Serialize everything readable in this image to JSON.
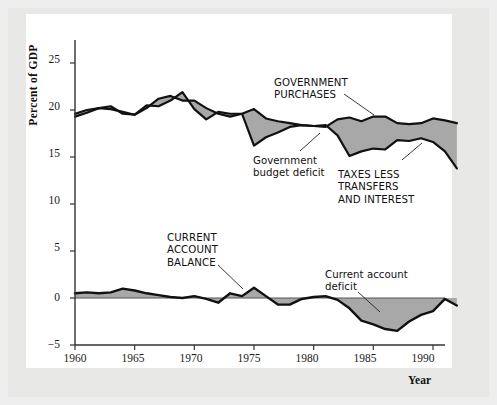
{
  "figure": {
    "name": "government-purchases-taxes-current-account-chart",
    "background_color": "#e8e8e6",
    "plot_background_color": "#ffffff",
    "fill_color": "#a8a8a8",
    "line_color": "#111111"
  },
  "axes": {
    "ylabel": "Percent of GDP",
    "xlabel": "Year",
    "y_ticks": [
      "25",
      "20",
      "15",
      "10",
      "5",
      "0",
      "−5"
    ],
    "y_tick_values": [
      25,
      20,
      15,
      10,
      5,
      0,
      -5
    ],
    "x_ticks": [
      "1960",
      "1965",
      "1970",
      "1975",
      "1980",
      "1985",
      "1990"
    ],
    "x_tick_values": [
      1960,
      1965,
      1970,
      1975,
      1980,
      1985,
      1990
    ]
  },
  "annotations": [
    {
      "id": "government-purchases",
      "text": "GOVERNMENT\nPURCHASES",
      "style": "caps"
    },
    {
      "id": "government-budget-deficit",
      "text": "Government\nbudget deficit",
      "style": "sentence"
    },
    {
      "id": "taxes-less-transfers-and-interest",
      "text": "TAXES LESS\nTRANSFERS\nAND INTEREST",
      "style": "caps"
    },
    {
      "id": "current-account-balance",
      "text": "CURRENT\nACCOUNT\nBALANCE",
      "style": "caps"
    },
    {
      "id": "current-account-deficit",
      "text": "Current account\ndeficit",
      "style": "sentence"
    }
  ],
  "chart_data": {
    "type": "area",
    "title": "",
    "xlabel": "Year",
    "ylabel": "Percent of GDP",
    "xlim": [
      1960,
      1992
    ],
    "ylim": [
      -5,
      26.5
    ],
    "grid": false,
    "legend": "annotations-inline",
    "x": [
      1960,
      1961,
      1962,
      1963,
      1964,
      1965,
      1966,
      1967,
      1968,
      1969,
      1970,
      1971,
      1972,
      1973,
      1974,
      1975,
      1976,
      1977,
      1978,
      1979,
      1980,
      1981,
      1982,
      1983,
      1984,
      1985,
      1986,
      1987,
      1988,
      1989,
      1990,
      1991,
      1992
    ],
    "series": [
      {
        "name": "GOVERNMENT PURCHASES",
        "values": [
          19.6,
          20.0,
          20.2,
          20.1,
          19.8,
          19.5,
          20.2,
          21.2,
          21.5,
          21.0,
          21.0,
          20.2,
          19.6,
          19.3,
          19.6,
          20.1,
          19.1,
          18.8,
          18.6,
          18.4,
          18.3,
          18.2,
          19.0,
          19.2,
          18.8,
          19.3,
          19.3,
          18.6,
          18.5,
          18.6,
          19.1,
          18.9,
          18.6
        ]
      },
      {
        "name": "TAXES LESS TRANSFERS AND INTEREST",
        "values": [
          19.3,
          19.7,
          20.2,
          20.4,
          19.6,
          19.5,
          20.5,
          20.4,
          21.0,
          21.9,
          20.1,
          19.0,
          19.8,
          19.6,
          19.6,
          16.2,
          17.1,
          17.6,
          18.2,
          18.4,
          18.3,
          18.4,
          17.3,
          15.1,
          15.6,
          15.9,
          15.8,
          16.8,
          16.7,
          17.0,
          16.6,
          15.6,
          13.8
        ]
      },
      {
        "name": "CURRENT ACCOUNT BALANCE",
        "values": [
          0.5,
          0.6,
          0.5,
          0.6,
          1.0,
          0.8,
          0.5,
          0.3,
          0.1,
          0.0,
          0.2,
          -0.1,
          -0.5,
          0.5,
          0.2,
          1.1,
          0.2,
          -0.7,
          -0.7,
          -0.1,
          0.1,
          0.2,
          -0.2,
          -1.1,
          -2.4,
          -2.8,
          -3.3,
          -3.5,
          -2.5,
          -1.8,
          -1.4,
          -0.1,
          -0.8
        ]
      }
    ],
    "shaded_regions": [
      {
        "name": "Government budget deficit",
        "between": [
          "GOVERNMENT PURCHASES",
          "TAXES LESS TRANSFERS AND INTEREST"
        ]
      },
      {
        "name": "Current account deficit",
        "between": [
          "CURRENT ACCOUNT BALANCE",
          "zero-line"
        ]
      }
    ]
  }
}
